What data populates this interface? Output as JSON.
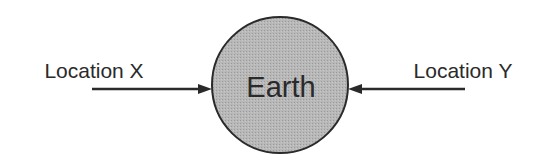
{
  "diagram": {
    "center_node": {
      "label": "Earth",
      "fill": "#b4b4b4",
      "stroke": "#2a2a2a"
    },
    "left_node": {
      "label": "Location X"
    },
    "right_node": {
      "label": "Location Y"
    },
    "arrows": [
      {
        "from": "Location X",
        "to": "Earth"
      },
      {
        "from": "Location Y",
        "to": "Earth"
      }
    ]
  }
}
